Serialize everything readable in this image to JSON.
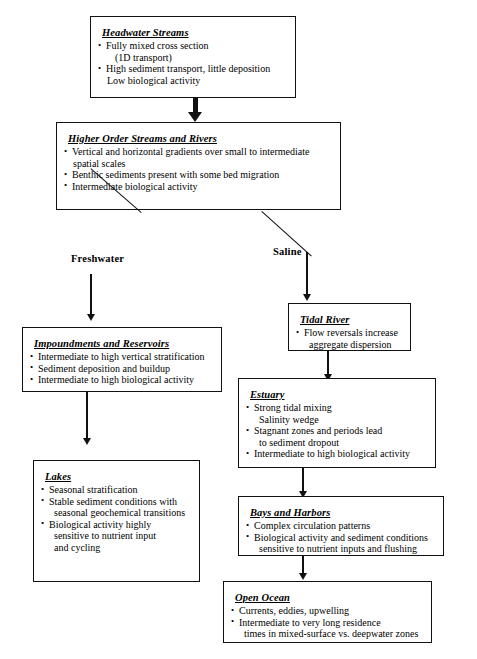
{
  "diagram": {
    "nodes": [
      {
        "id": "headwater-streams",
        "title": "Headwater Streams",
        "lines": [
          {
            "text": "Fully mixed cross section",
            "style": "bulleted"
          },
          {
            "text": "(1D transport)",
            "style": "cont-deep"
          },
          {
            "text": "High sediment transport, little deposition",
            "style": "bulleted"
          },
          {
            "text": "Low biological activity",
            "style": "nobullet"
          }
        ]
      },
      {
        "id": "higher-order-streams-and-rivers",
        "title": "Higher Order Streams and Rivers",
        "lines": [
          {
            "text": "Vertical and horizontal gradients over small to intermediate",
            "style": "bulleted"
          },
          {
            "text": "spatial scales",
            "style": "nobullet"
          },
          {
            "text": "Benthic sediments present with some bed migration",
            "style": "bulleted"
          },
          {
            "text": "Intermediate biological activity",
            "style": "bulleted"
          }
        ]
      },
      {
        "id": "tidal-river",
        "title": "Tidal River",
        "lines": [
          {
            "text": "Flow reversals increase",
            "style": "bulleted"
          },
          {
            "text": "aggregate dispersion",
            "style": "cont"
          }
        ]
      },
      {
        "id": "impoundments-and-reservoirs",
        "title": "Impoundments and Reservoirs",
        "lines": [
          {
            "text": "Intermediate to high vertical stratification",
            "style": "bulleted"
          },
          {
            "text": "Sediment deposition and buildup",
            "style": "bulleted"
          },
          {
            "text": "Intermediate to high biological activity",
            "style": "bulleted"
          }
        ]
      },
      {
        "id": "estuary",
        "title": "Estuary",
        "lines": [
          {
            "text": "Strong tidal mixing",
            "style": "bulleted"
          },
          {
            "text": "Salinity wedge",
            "style": "cont"
          },
          {
            "text": "Stagnant zones and periods lead",
            "style": "bulleted"
          },
          {
            "text": "to sediment dropout",
            "style": "cont"
          },
          {
            "text": "Intermediate to high biological activity",
            "style": "bulleted"
          }
        ]
      },
      {
        "id": "lakes",
        "title": "Lakes",
        "lines": [
          {
            "text": "Seasonal stratification",
            "style": "bulleted"
          },
          {
            "text": "Stable sediment conditions with",
            "style": "bulleted"
          },
          {
            "text": "seasonal geochemical transitions",
            "style": "cont"
          },
          {
            "text": "Biological activity highly",
            "style": "bulleted"
          },
          {
            "text": "sensitive to nutrient input",
            "style": "cont"
          },
          {
            "text": "and cycling",
            "style": "cont"
          }
        ]
      },
      {
        "id": "bays-and-harbors",
        "title": "Bays and Harbors",
        "lines": [
          {
            "text": "Complex circulation patterns",
            "style": "bulleted"
          },
          {
            "text": "Biological activity and sediment conditions",
            "style": "bulleted"
          },
          {
            "text": "sensitive to nutrient inputs and flushing",
            "style": "cont"
          }
        ]
      },
      {
        "id": "open-ocean",
        "title": "Open Ocean",
        "lines": [
          {
            "text": "Currents, eddies, upwelling",
            "style": "bulleted"
          },
          {
            "text": "Intermediate to very long residence",
            "style": "bulleted"
          },
          {
            "text": "times in mixed-surface vs. deepwater zones",
            "style": "cont"
          }
        ]
      }
    ],
    "branch_labels": [
      {
        "id": "freshwater",
        "text": "Freshwater"
      },
      {
        "id": "saline",
        "text": "Saline"
      }
    ],
    "colors": {
      "stroke": "#111111",
      "background": "#ffffff",
      "text": "#000000"
    }
  }
}
